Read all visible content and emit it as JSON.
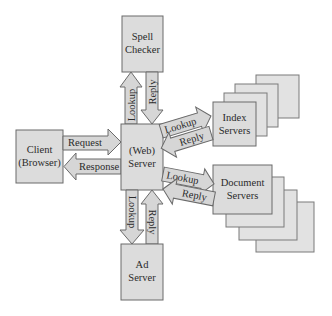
{
  "diagram": {
    "nodes": {
      "spell_checker": {
        "line1": "Spell",
        "line2": "Checker"
      },
      "client": {
        "line1": "Client",
        "line2": "(Browser)"
      },
      "web_server": {
        "line1": "(Web)",
        "line2": "Server"
      },
      "ad_server": {
        "line1": "Ad",
        "line2": "Server"
      },
      "index_servers": {
        "line1": "Index",
        "line2": "Servers"
      },
      "document_servers": {
        "line1": "Document",
        "line2": "Servers"
      }
    },
    "edges": {
      "request": "Request",
      "response": "Response",
      "spell_lookup": "Lookup",
      "spell_reply": "Reply",
      "ad_lookup": "Lookup",
      "ad_reply": "Reply",
      "index_lookup": "Lookup",
      "index_reply": "Reply",
      "doc_lookup": "Lookup",
      "doc_reply": "Reply"
    },
    "colors": {
      "box_fill": "#dcdcdc",
      "box_stroke": "#6a6a6a",
      "text": "#2a2a2a"
    }
  }
}
